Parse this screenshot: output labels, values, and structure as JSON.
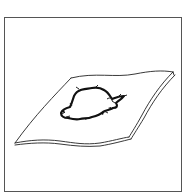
{
  "figure": {
    "caption_visible_text": "",
    "colors": {
      "background": "#ffffff",
      "frame": "#555555",
      "line": "#222222",
      "stain": "#111111"
    }
  }
}
